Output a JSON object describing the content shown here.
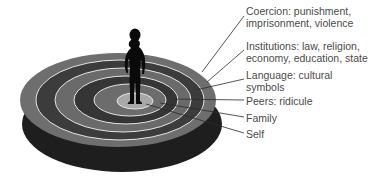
{
  "figure": {
    "rings": [
      {
        "id": "coercion",
        "label_lines": [
          "Coercion: punishment,",
          "imprisonment, violence"
        ],
        "fill": "#6e6e6e"
      },
      {
        "id": "institutions",
        "label_lines": [
          "Institutions: law, religion,",
          "economy, education, state"
        ],
        "fill": "#3c3c3c"
      },
      {
        "id": "language",
        "label_lines": [
          "Language: cultural",
          "symbols"
        ],
        "fill": "#6a6a6a"
      },
      {
        "id": "peers",
        "label_lines": [
          "Peers: ridicule"
        ],
        "fill": "#353535"
      },
      {
        "id": "family",
        "label_lines": [
          "Family"
        ],
        "fill": "#6c6c6c"
      },
      {
        "id": "self",
        "label_lines": [
          "Self"
        ],
        "fill": "#a8a8a8"
      }
    ],
    "colors": {
      "ring_separator": "#e6e6e6",
      "shadow": "#1e1e1e",
      "silhouette": "#0a0a0a",
      "leader_line": "#2a2a2a",
      "label_text": "#4a4a4a"
    }
  }
}
